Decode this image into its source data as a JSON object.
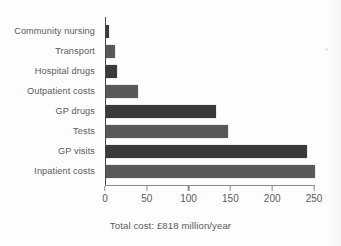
{
  "chart_data": {
    "type": "bar",
    "orientation": "horizontal",
    "title": "",
    "xlabel": "Total cost: £818 million/year",
    "ylabel": "",
    "xlim": [
      0,
      250
    ],
    "xticks": [
      0,
      50,
      100,
      150,
      200,
      250
    ],
    "grid": false,
    "legend": false,
    "categories": [
      "Community nursing",
      "Transport",
      "Hospital drugs",
      "Outpatient costs",
      "GP drugs",
      "Tests",
      "GP visits",
      "Inpatient costs"
    ],
    "values": [
      4,
      11,
      13,
      38,
      132,
      146,
      240,
      250
    ],
    "bar_colors": [
      "#3a3a3a",
      "#595959",
      "#3a3a3a",
      "#595959",
      "#3a3a3a",
      "#595959",
      "#3a3a3a",
      "#595959"
    ]
  },
  "caption": "Total cost: £818 million/year",
  "colors": {
    "background": "#fdfdfd",
    "bar_dark": "#3a3a3a",
    "bar_light": "#595959",
    "axis": "#4a4a4a",
    "text": "#5a5a5a"
  }
}
